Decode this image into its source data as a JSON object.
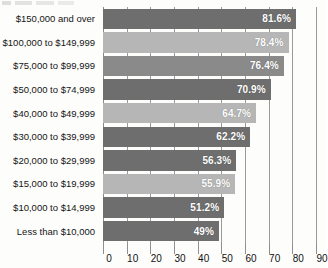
{
  "chart_data": {
    "type": "bar",
    "orientation": "horizontal",
    "title": "",
    "xlabel": "",
    "ylabel": "",
    "xlim": [
      0,
      90
    ],
    "xticks": [
      0,
      10,
      20,
      30,
      40,
      50,
      60,
      70,
      80,
      90
    ],
    "grid": true,
    "legend": "none",
    "value_suffix": "%",
    "categories": [
      "$150,000 and over",
      "$100,000 to $149,999",
      "$75,000 to $99,999",
      "$50,000 to $74,999",
      "$40,000 to $49,999",
      "$30,000 to $39,999",
      "$20,000 to $29,999",
      "$15,000 to $19,999",
      "$10,000 to $14,999",
      "Less than $10,000"
    ],
    "values": [
      81.6,
      78.4,
      76.4,
      70.9,
      64.7,
      62.2,
      56.3,
      55.9,
      51.2,
      49
    ],
    "value_labels": [
      "81.6%",
      "78.4%",
      "76.4%",
      "70.9%",
      "64.7%",
      "62.2%",
      "56.3%",
      "55.9%",
      "51.2%",
      "49%"
    ],
    "bar_colors": [
      "#6e6e6e",
      "#b6b6b6",
      "#8a8a8a",
      "#6e6e6e",
      "#b6b6b6",
      "#6e6e6e",
      "#6e6e6e",
      "#b6b6b6",
      "#6e6e6e",
      "#6e6e6e"
    ],
    "colors": {
      "dark_bar": "#6e6e6e",
      "light_bar": "#b6b6b6",
      "gridline": "#9a9a9a",
      "value_text": "#ffffff",
      "axis_text": "#111111",
      "category_text": "#151515",
      "background": "#fdfdfb"
    }
  }
}
